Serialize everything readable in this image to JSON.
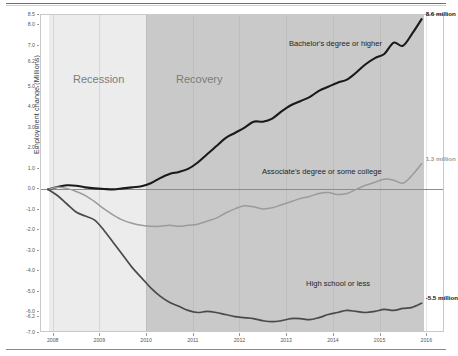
{
  "chart_data": {
    "type": "line",
    "title": "",
    "xlabel": "",
    "ylabel": "Employment change (Millions)",
    "ylim": [
      -7.0,
      8.5
    ],
    "xlim": [
      2007.75,
      2016.4
    ],
    "grid": false,
    "legend_position": "inline-annotations",
    "yticks": [
      "8.5",
      "8.0",
      "7.0",
      "6.2",
      "5.0",
      "4.0",
      "3.0",
      "2.0",
      "1.0",
      "0.0",
      "-1.0",
      "-2.0",
      "-3.0",
      "-4.0",
      "-5.0",
      "-6.0",
      "-6.2",
      "-7.0"
    ],
    "ytick_values": [
      8.5,
      8.0,
      7.0,
      6.2,
      5.0,
      4.0,
      3.0,
      2.0,
      1.0,
      0.0,
      -1.0,
      -2.0,
      -3.0,
      -4.0,
      -5.0,
      -6.0,
      -6.2,
      -7.0
    ],
    "xticks": [
      "2008",
      "2009",
      "2010",
      "2011",
      "2012",
      "2013",
      "2014",
      "2015",
      "2016"
    ],
    "xtick_values": [
      2008,
      2009,
      2010,
      2011,
      2012,
      2013,
      2014,
      2015,
      2016
    ],
    "bands": [
      {
        "name": "Recession",
        "label": "Recession",
        "start": 2007.92,
        "end": 2010.0,
        "color": "#ececec"
      },
      {
        "name": "Recovery",
        "label": "Recovery",
        "start": 2010.0,
        "end": 2015.95,
        "color": "#c9c9c9"
      }
    ],
    "series": [
      {
        "name": "Bachelor's degree or higher",
        "label": "Bachelor's degree or higher",
        "color": "#1a1a1a",
        "width": 2.1,
        "end_label": "8.6 million",
        "x": [
          2007.9,
          2008.1,
          2008.3,
          2008.5,
          2008.7,
          2008.9,
          2009.1,
          2009.3,
          2009.5,
          2009.7,
          2009.9,
          2010.1,
          2010.3,
          2010.5,
          2010.7,
          2010.9,
          2011.1,
          2011.3,
          2011.5,
          2011.7,
          2011.9,
          2012.1,
          2012.3,
          2012.5,
          2012.7,
          2012.9,
          2013.1,
          2013.3,
          2013.5,
          2013.7,
          2013.9,
          2014.1,
          2014.3,
          2014.5,
          2014.7,
          2014.9,
          2015.1,
          2015.3,
          2015.5,
          2015.7,
          2015.9
        ],
        "y": [
          0.0,
          0.12,
          0.2,
          0.18,
          0.1,
          0.05,
          0.02,
          0.0,
          0.05,
          0.1,
          0.15,
          0.3,
          0.55,
          0.75,
          0.85,
          1.0,
          1.3,
          1.7,
          2.1,
          2.5,
          2.75,
          3.0,
          3.3,
          3.3,
          3.45,
          3.8,
          4.1,
          4.3,
          4.5,
          4.8,
          5.0,
          5.2,
          5.35,
          5.7,
          6.1,
          6.4,
          6.6,
          7.15,
          7.0,
          7.6,
          8.3
        ]
      },
      {
        "name": "Associate's degree or some college",
        "label": "Associate's degree or some college",
        "color": "#9b9b9b",
        "width": 1.5,
        "end_label": "1.3 million",
        "x": [
          2007.9,
          2008.1,
          2008.3,
          2008.5,
          2008.7,
          2008.9,
          2009.1,
          2009.3,
          2009.5,
          2009.7,
          2009.9,
          2010.1,
          2010.3,
          2010.5,
          2010.7,
          2010.9,
          2011.1,
          2011.3,
          2011.5,
          2011.7,
          2011.9,
          2012.1,
          2012.3,
          2012.5,
          2012.7,
          2012.9,
          2013.1,
          2013.3,
          2013.5,
          2013.7,
          2013.9,
          2014.1,
          2014.3,
          2014.5,
          2014.7,
          2014.9,
          2015.1,
          2015.3,
          2015.5,
          2015.7,
          2015.9
        ],
        "y": [
          0.0,
          0.1,
          0.05,
          -0.1,
          -0.3,
          -0.6,
          -0.95,
          -1.25,
          -1.5,
          -1.65,
          -1.75,
          -1.8,
          -1.8,
          -1.75,
          -1.8,
          -1.75,
          -1.7,
          -1.55,
          -1.4,
          -1.15,
          -0.95,
          -0.8,
          -0.85,
          -0.95,
          -0.9,
          -0.75,
          -0.6,
          -0.45,
          -0.35,
          -0.2,
          -0.15,
          -0.25,
          -0.2,
          0.0,
          0.2,
          0.35,
          0.5,
          0.45,
          0.3,
          0.7,
          1.25
        ]
      },
      {
        "name": "High school or less",
        "label": "High school or less",
        "color": "#4a4a4a",
        "width": 1.7,
        "end_label": "-5.5 million",
        "x": [
          2007.9,
          2008.1,
          2008.3,
          2008.5,
          2008.7,
          2008.9,
          2009.1,
          2009.3,
          2009.5,
          2009.7,
          2009.9,
          2010.1,
          2010.3,
          2010.5,
          2010.7,
          2010.9,
          2011.1,
          2011.3,
          2011.5,
          2011.7,
          2011.9,
          2012.1,
          2012.3,
          2012.5,
          2012.7,
          2012.9,
          2013.1,
          2013.3,
          2013.5,
          2013.7,
          2013.9,
          2014.1,
          2014.3,
          2014.5,
          2014.7,
          2014.9,
          2015.1,
          2015.3,
          2015.5,
          2015.7,
          2015.9
        ],
        "y": [
          0.0,
          -0.3,
          -0.7,
          -1.1,
          -1.3,
          -1.5,
          -2.0,
          -2.6,
          -3.2,
          -3.8,
          -4.3,
          -4.8,
          -5.2,
          -5.5,
          -5.7,
          -5.9,
          -6.0,
          -5.95,
          -6.0,
          -6.1,
          -6.2,
          -6.25,
          -6.3,
          -6.4,
          -6.45,
          -6.4,
          -6.3,
          -6.3,
          -6.35,
          -6.25,
          -6.1,
          -6.0,
          -5.9,
          -5.95,
          -6.0,
          -5.95,
          -5.85,
          -5.9,
          -5.8,
          -5.75,
          -5.55
        ]
      }
    ],
    "annotations": [
      {
        "name": "bachelors-inline-label",
        "text": "Bachelor's degree or higher",
        "x_px": 288,
        "y_px": 38
      },
      {
        "name": "associates-inline-label",
        "text": "Associate's degree or some college",
        "x_px": 261,
        "y_px": 166
      },
      {
        "name": "highschool-inline-label",
        "text": "High school or less",
        "x_px": 305,
        "y_px": 278
      }
    ]
  }
}
